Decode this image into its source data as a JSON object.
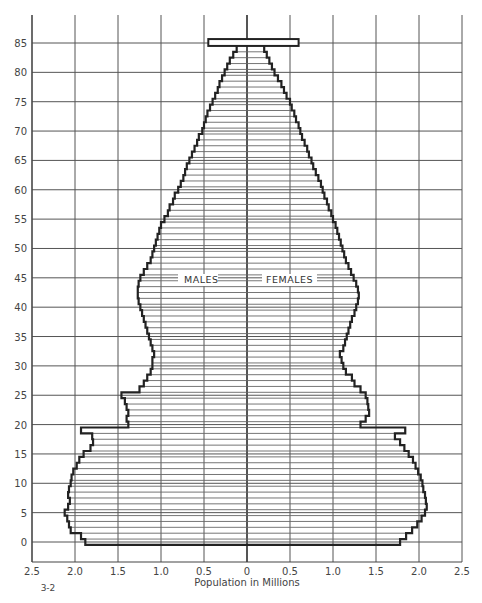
{
  "chart_data": {
    "type": "bar",
    "subtype": "population-pyramid",
    "title": "",
    "xlabel": "Population in Millions",
    "ylabel": "",
    "figure_number": "3-2",
    "x_ticks_left": [
      "2.5",
      "2.0",
      "1.5",
      "1.0",
      "0.5"
    ],
    "x_ticks_center": "0",
    "x_ticks_right": [
      "0.5",
      "1.0",
      "1.5",
      "2.0",
      "2.5"
    ],
    "xlim": [
      -2.5,
      2.5
    ],
    "y_ticks": [
      "0",
      "5",
      "10",
      "15",
      "20",
      "25",
      "30",
      "35",
      "40",
      "45",
      "50",
      "55",
      "60",
      "65",
      "70",
      "75",
      "80",
      "85"
    ],
    "ylim": [
      0,
      85
    ],
    "grid": true,
    "legend": [
      "MALES",
      "FEMALES"
    ],
    "categories": [
      0,
      1,
      2,
      3,
      4,
      5,
      6,
      7,
      8,
      9,
      10,
      11,
      12,
      13,
      14,
      15,
      16,
      17,
      18,
      19,
      20,
      21,
      22,
      23,
      24,
      25,
      26,
      27,
      28,
      29,
      30,
      31,
      32,
      33,
      34,
      35,
      36,
      37,
      38,
      39,
      40,
      41,
      42,
      43,
      44,
      45,
      46,
      47,
      48,
      49,
      50,
      51,
      52,
      53,
      54,
      55,
      56,
      57,
      58,
      59,
      60,
      61,
      62,
      63,
      64,
      65,
      66,
      67,
      68,
      69,
      70,
      71,
      72,
      73,
      74,
      75,
      76,
      77,
      78,
      79,
      80,
      81,
      82,
      83,
      84,
      "85+"
    ],
    "series": [
      {
        "name": "MALES",
        "values": [
          1.88,
          1.93,
          2.05,
          2.07,
          2.09,
          2.12,
          2.08,
          2.06,
          2.08,
          2.07,
          2.05,
          2.04,
          2.02,
          1.98,
          1.95,
          1.9,
          1.82,
          1.79,
          1.8,
          1.93,
          1.38,
          1.4,
          1.38,
          1.4,
          1.42,
          1.46,
          1.25,
          1.2,
          1.16,
          1.12,
          1.1,
          1.1,
          1.08,
          1.1,
          1.12,
          1.14,
          1.16,
          1.18,
          1.2,
          1.22,
          1.24,
          1.26,
          1.27,
          1.27,
          1.26,
          1.24,
          1.2,
          1.16,
          1.12,
          1.1,
          1.08,
          1.06,
          1.04,
          1.02,
          1.0,
          0.96,
          0.92,
          0.9,
          0.86,
          0.84,
          0.8,
          0.77,
          0.74,
          0.72,
          0.7,
          0.67,
          0.64,
          0.61,
          0.58,
          0.56,
          0.52,
          0.5,
          0.48,
          0.46,
          0.43,
          0.4,
          0.37,
          0.34,
          0.32,
          0.29,
          0.26,
          0.23,
          0.2,
          0.16,
          0.12,
          0.45
        ]
      },
      {
        "name": "FEMALES",
        "values": [
          1.78,
          1.85,
          1.92,
          1.98,
          2.03,
          2.07,
          2.09,
          2.08,
          2.07,
          2.05,
          2.04,
          2.02,
          1.99,
          1.96,
          1.93,
          1.88,
          1.83,
          1.78,
          1.72,
          1.84,
          1.32,
          1.38,
          1.42,
          1.41,
          1.4,
          1.38,
          1.32,
          1.25,
          1.22,
          1.15,
          1.12,
          1.1,
          1.08,
          1.12,
          1.14,
          1.16,
          1.18,
          1.2,
          1.22,
          1.25,
          1.27,
          1.29,
          1.3,
          1.29,
          1.27,
          1.24,
          1.21,
          1.18,
          1.15,
          1.13,
          1.11,
          1.09,
          1.07,
          1.05,
          1.03,
          1.0,
          0.98,
          0.95,
          0.93,
          0.9,
          0.88,
          0.86,
          0.83,
          0.8,
          0.77,
          0.75,
          0.72,
          0.7,
          0.67,
          0.64,
          0.62,
          0.6,
          0.57,
          0.55,
          0.52,
          0.5,
          0.46,
          0.43,
          0.4,
          0.36,
          0.32,
          0.29,
          0.26,
          0.23,
          0.2,
          0.6
        ]
      }
    ]
  },
  "labels": {
    "males": "MALES",
    "females": "FEMALES",
    "x_axis_title": "Population in Millions",
    "figure_number": "3-2"
  }
}
